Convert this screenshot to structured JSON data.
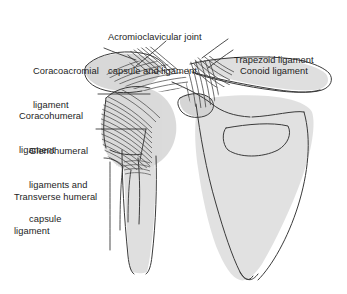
{
  "figure": {
    "background_color": "#ffffff",
    "line_color": "#3a3a3a",
    "bone_fill": "#d9d9d9",
    "text_color": "#1d1d1d"
  },
  "labels": [
    {
      "id": "acromioclavicular",
      "line1": "Acromioclavicular joint",
      "line2": "capsule and ligament"
    },
    {
      "id": "trapezoid",
      "line1": "Trapezoid ligament"
    },
    {
      "id": "conoid",
      "line1": "Conoid ligament"
    },
    {
      "id": "coracoacromial",
      "line1": "Coracoacromial",
      "line2": "ligament"
    },
    {
      "id": "coracohumeral",
      "line1": "Coracohumeral",
      "line2": "ligament"
    },
    {
      "id": "glenohumeral",
      "line1": "Glenohumeral",
      "line2": "ligaments and",
      "line3": "capsule"
    },
    {
      "id": "transverse_humeral",
      "line1": "Transverse humeral",
      "line2": "ligament"
    }
  ],
  "structures": [
    "clavicle",
    "acromion",
    "coracoid-process",
    "scapula-body",
    "humeral-head",
    "humerus-shaft",
    "glenohumeral-capsule-fibers",
    "coracoacromial-ligament-fibers",
    "conoid-trapezoid-fibers",
    "acromioclavicular-ligament-fibers"
  ]
}
